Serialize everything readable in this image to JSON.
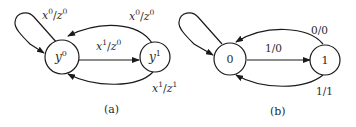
{
  "diagrams": [
    {
      "caption": "(a)",
      "states": [
        {
          "id": "s0",
          "base": "y",
          "sup": "0"
        },
        {
          "id": "s1",
          "base": "y",
          "sup": "1"
        }
      ],
      "transitions": [
        {
          "from": "s0",
          "to": "s0",
          "label": {
            "x": "x",
            "xs": "0",
            "z": "z",
            "zs": "0"
          }
        },
        {
          "from": "s1",
          "to": "s0",
          "label": {
            "x": "x",
            "xs": "0",
            "z": "z",
            "zs": "0"
          }
        },
        {
          "from": "s0",
          "to": "s1",
          "label": {
            "x": "x",
            "xs": "1",
            "z": "z",
            "zs": "0"
          }
        },
        {
          "from": "s1",
          "to": "s0",
          "label": {
            "x": "x",
            "xs": "1",
            "z": "z",
            "zs": "1"
          }
        }
      ]
    },
    {
      "caption": "(b)",
      "states": [
        {
          "id": "s0",
          "label": "0"
        },
        {
          "id": "s1",
          "label": "1"
        }
      ],
      "transitions": [
        {
          "from": "s0",
          "to": "s0",
          "label": ""
        },
        {
          "from": "s1",
          "to": "s0",
          "label": "0/0"
        },
        {
          "from": "s0",
          "to": "s1",
          "label": "1/0"
        },
        {
          "from": "s1",
          "to": "s0",
          "label": "1/1"
        }
      ]
    }
  ],
  "separator": "/",
  "colors": {
    "stroke": "#1a1a1a",
    "text": "#2a2a2a",
    "background": "#ffffff"
  }
}
